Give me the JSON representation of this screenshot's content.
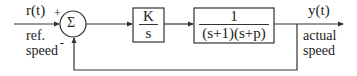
{
  "diagram": {
    "type": "feedback-control-block-diagram",
    "input": {
      "signal": "r(t)",
      "label_line1": "ref.",
      "label_line2": "speed"
    },
    "output": {
      "signal": "y(t)",
      "label_line1": "actual",
      "label_line2": "speed"
    },
    "summing_junction": {
      "symbol": "Σ",
      "plus_sign": "+",
      "minus_sign": "-"
    },
    "blocks": [
      {
        "id": "controller",
        "numerator": "K",
        "denominator": "s"
      },
      {
        "id": "plant",
        "numerator": "1",
        "denominator": "(s+1)(s+p)"
      }
    ],
    "feedback": "unity negative feedback",
    "colors": {
      "line": "#333333",
      "background": "#ffffff"
    }
  }
}
